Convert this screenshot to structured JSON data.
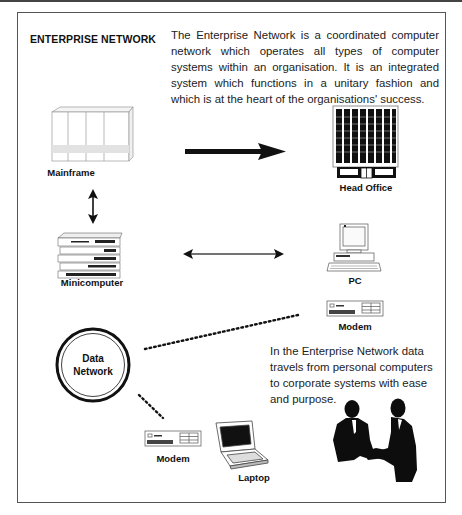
{
  "diagram": {
    "title": "ENTERPRISE NETWORK",
    "intro_text": "The Enterprise Network is a coordinated computer network which operates all types of computer systems within an organisation. It is an integrated system which functions in a unitary fashion and which is at the heart of the organisations' success.",
    "side_text": "In the Enterprise Network data travels from personal computers to corporate systems with ease and purpose.",
    "nodes": {
      "mainframe": {
        "label": "Mainframe",
        "icon": "mainframe-icon"
      },
      "head_office": {
        "label": "Head Office",
        "icon": "building-icon"
      },
      "minicomputer": {
        "label": "Minicomputer",
        "icon": "minicomputer-icon"
      },
      "pc": {
        "label": "PC",
        "icon": "desktop-pc-icon"
      },
      "modem_1": {
        "label": "Modem",
        "icon": "modem-icon"
      },
      "data_network": {
        "label_line1": "Data",
        "label_line2": "Network",
        "icon": "network-circle-icon"
      },
      "modem_2": {
        "label": "Modem",
        "icon": "modem-icon"
      },
      "laptop": {
        "label": "Laptop",
        "icon": "laptop-icon"
      },
      "handshake": {
        "icon": "handshake-icon"
      }
    },
    "connections": [
      {
        "from": "Mainframe",
        "to": "Head Office",
        "style": "thick-arrow"
      },
      {
        "from": "Mainframe",
        "to": "Minicomputer",
        "style": "double-arrow"
      },
      {
        "from": "Minicomputer",
        "to": "PC",
        "style": "double-arrow"
      },
      {
        "from": "Data Network",
        "to": "Modem",
        "style": "dotted"
      },
      {
        "from": "Data Network",
        "to": "Modem",
        "style": "dotted"
      }
    ]
  }
}
